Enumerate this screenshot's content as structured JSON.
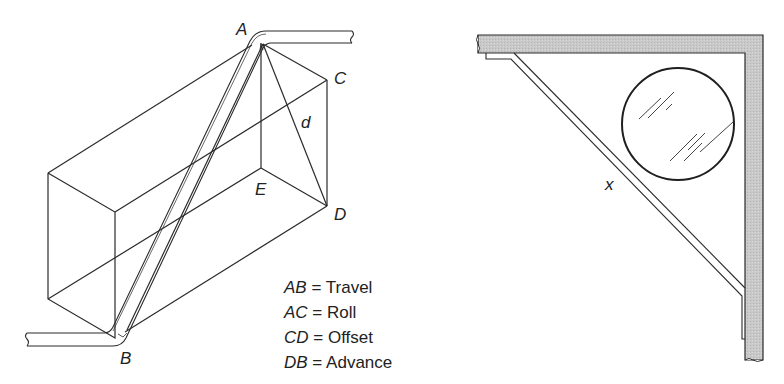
{
  "left_figure": {
    "title": "Rolling offset pipe diagram",
    "points": {
      "A": "A",
      "B": "B",
      "C": "C",
      "D": "D",
      "E": "E",
      "d": "d"
    },
    "legend": [
      {
        "key": "AB",
        "eq": "=",
        "value": "Travel"
      },
      {
        "key": "AC",
        "eq": "=",
        "value": "Roll"
      },
      {
        "key": "CD",
        "eq": "=",
        "value": "Offset"
      },
      {
        "key": "DB",
        "eq": "=",
        "value": "Advance"
      }
    ]
  },
  "right_figure": {
    "title": "Corner bracket with circular mirror",
    "label_x": "x"
  },
  "colors": {
    "line": "#2b2b2b",
    "wall_fill": "#c8c8c8",
    "background": "#ffffff"
  }
}
